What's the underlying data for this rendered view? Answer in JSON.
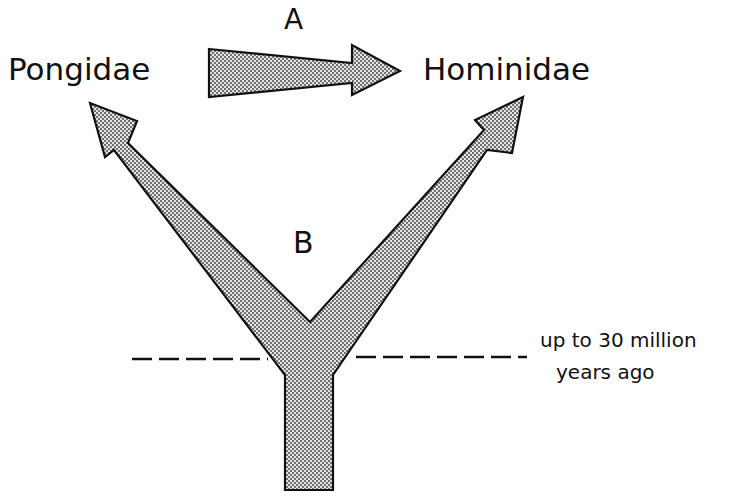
{
  "diagram": {
    "type": "evolutionary-relationship",
    "labels": {
      "pongidae": "Pongidae",
      "hominidae": "Hominidae",
      "arrow_a": "A",
      "arrow_b": "B",
      "time_line1": "up to 30 million",
      "time_line2": "years ago"
    },
    "nodes": [
      "Pongidae",
      "Hominidae"
    ],
    "edges": [
      {
        "label": "A",
        "from": "Pongidae",
        "to": "Hominidae",
        "kind": "direct-descent"
      },
      {
        "label": "B",
        "from": "common-ancestor",
        "to": [
          "Pongidae",
          "Hominidae"
        ],
        "kind": "divergence"
      }
    ],
    "colors": {
      "stroke": "#111111",
      "fill": "#bdbdbd",
      "dot": "#3a3a3a"
    }
  }
}
